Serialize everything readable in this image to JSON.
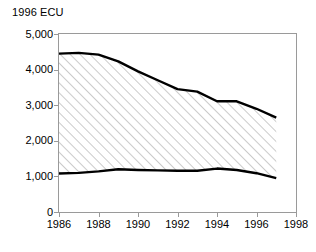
{
  "chart_data": {
    "type": "area",
    "title": "1996 ECU",
    "xlabel": "",
    "ylabel": "",
    "xlim": [
      1986,
      1998
    ],
    "ylim": [
      0,
      5000
    ],
    "grid": false,
    "legend": "none",
    "style": {
      "band_fill": "diagonal-hatch",
      "hatch_color": "#b0b0b0",
      "hatch_background": "#ffffff",
      "line_color": "#000000",
      "line_width_px": 2.4,
      "frame_color": "#9a9a9a",
      "plot_background": "#ffffff"
    },
    "y_ticks": [
      0,
      1000,
      2000,
      3000,
      4000,
      5000
    ],
    "y_tick_labels": [
      "0",
      "1,000",
      "2,000",
      "3,000",
      "4,000",
      "5,000"
    ],
    "x_ticks": [
      1986,
      1988,
      1990,
      1992,
      1994,
      1996,
      1998
    ],
    "x_tick_labels": [
      "1986",
      "1988",
      "1990",
      "1992",
      "1994",
      "1996",
      "1998"
    ],
    "x": [
      1986,
      1987,
      1988,
      1989,
      1990,
      1991,
      1992,
      1993,
      1994,
      1995,
      1996,
      1997
    ],
    "series": [
      {
        "name": "upper-bound",
        "values": [
          4450,
          4470,
          4420,
          4230,
          3950,
          3700,
          3450,
          3380,
          3110,
          3110,
          2900,
          2650
        ]
      },
      {
        "name": "lower-bound",
        "values": [
          1080,
          1100,
          1140,
          1200,
          1180,
          1170,
          1160,
          1160,
          1220,
          1180,
          1090,
          950
        ]
      }
    ],
    "annotations": []
  },
  "chart": {
    "title": "1996 ECU"
  }
}
